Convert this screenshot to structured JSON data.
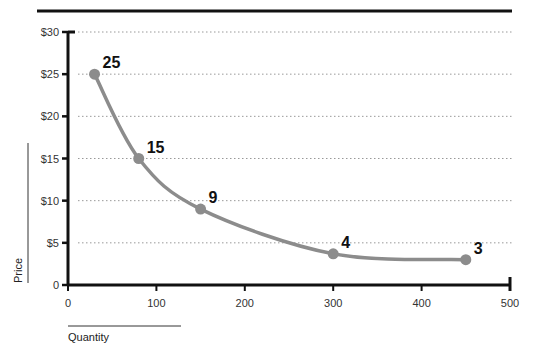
{
  "chart_data": {
    "type": "line",
    "title": "",
    "xlabel": "Quantity",
    "ylabel": "Price",
    "xlim": [
      0,
      500
    ],
    "ylim": [
      0,
      30
    ],
    "x_ticks": [
      "0",
      "100",
      "200",
      "300",
      "400",
      "500"
    ],
    "y_ticks": [
      "0",
      "$5",
      "$10",
      "$15",
      "$20",
      "$25",
      "$30"
    ],
    "grid": "horizontal dotted",
    "legend": null,
    "series": [
      {
        "name": "Demand curve",
        "color": "#8c8c8c",
        "points": [
          {
            "x": 30,
            "y": 25,
            "label": "25"
          },
          {
            "x": 80,
            "y": 15,
            "label": "15"
          },
          {
            "x": 150,
            "y": 9,
            "label": "9"
          },
          {
            "x": 300,
            "y": 4,
            "label": "4"
          },
          {
            "x": 450,
            "y": 3,
            "label": "3"
          }
        ]
      }
    ]
  },
  "colors": {
    "axis": "#111111",
    "grid": "#999999",
    "line": "#8c8c8c",
    "marker": "#8c8c8c"
  }
}
